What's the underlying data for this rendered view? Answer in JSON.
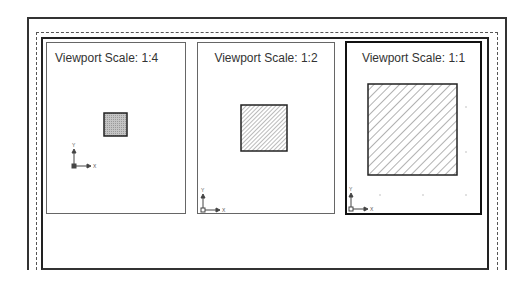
{
  "layout": {
    "paper_sheet": "layout-sheet",
    "printable_area": "dashed-margin"
  },
  "viewports": [
    {
      "label": "Viewport Scale: 1:4",
      "scale": "1:4",
      "active": false,
      "fill": "solid-gray"
    },
    {
      "label": "Viewport Scale: 1:2",
      "scale": "1:2",
      "active": false,
      "fill": "hatch"
    },
    {
      "label": "Viewport Scale: 1:1",
      "scale": "1:1",
      "active": true,
      "fill": "hatch"
    }
  ],
  "ucs_icon": {
    "x_label": "X",
    "y_label": "Y"
  },
  "colors": {
    "line": "#222222",
    "hatch": "#555555",
    "fill_gray": "#b5b5b5",
    "background": "#ffffff"
  }
}
